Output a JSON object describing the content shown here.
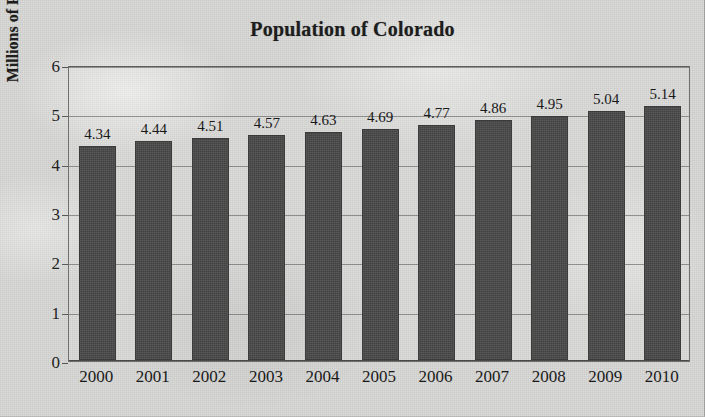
{
  "chart_data": {
    "type": "bar",
    "title": "Population of Colorado",
    "xlabel": "",
    "ylabel": "Millions of People",
    "categories": [
      "2000",
      "2001",
      "2002",
      "2003",
      "2004",
      "2005",
      "2006",
      "2007",
      "2008",
      "2009",
      "2010"
    ],
    "values": [
      4.34,
      4.44,
      4.51,
      4.57,
      4.63,
      4.69,
      4.77,
      4.86,
      4.95,
      5.04,
      5.14
    ],
    "value_labels": [
      "4.34",
      "4.44",
      "4.51",
      "4.57",
      "4.63",
      "4.69",
      "4.77",
      "4.86",
      "4.95",
      "5.04",
      "5.14"
    ],
    "ylim": [
      0,
      6
    ],
    "y_ticks": [
      0,
      1,
      2,
      3,
      4,
      5,
      6
    ],
    "y_tick_labels": [
      "0",
      "1",
      "2",
      "3",
      "4",
      "5",
      "6"
    ],
    "grid": true,
    "grid_axis": "y",
    "legend": false,
    "legend_position": "none",
    "bar_color": "#494949",
    "plot_border_color": "#6e6e6e",
    "background_color": "#d9d9d7",
    "text_color": "#1b1b1b",
    "data_labels_shown": true,
    "series": [
      {
        "name": "Population",
        "values": [
          4.34,
          4.44,
          4.51,
          4.57,
          4.63,
          4.69,
          4.77,
          4.86,
          4.95,
          5.04,
          5.14
        ]
      }
    ]
  }
}
